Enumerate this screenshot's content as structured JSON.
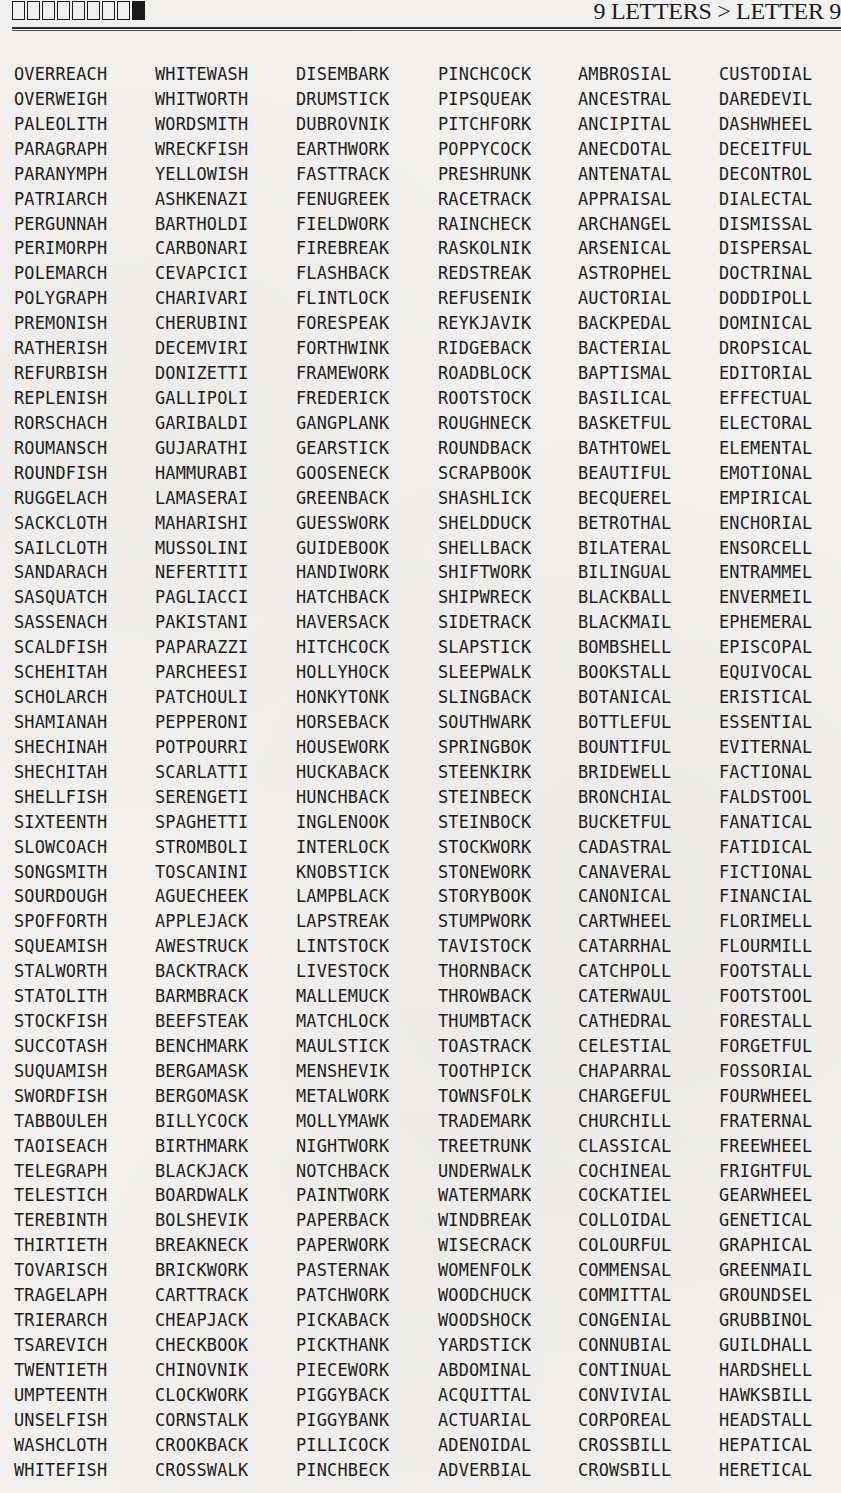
{
  "header": {
    "letter_boxes": {
      "total": 9,
      "filled_index": 8,
      "icon": "letter-position-boxes"
    },
    "breadcrumb": "9 LETTERS > LETTER 9"
  },
  "columns": [
    [
      "OVERREACH",
      "OVERWEIGH",
      "PALEOLITH",
      "PARAGRAPH",
      "PARANYMPH",
      "PATRIARCH",
      "PERGUNNAH",
      "PERIMORPH",
      "POLEMARCH",
      "POLYGRAPH",
      "PREMONISH",
      "RATHERISH",
      "REFURBISH",
      "REPLENISH",
      "RORSCHACH",
      "ROUMANSCH",
      "ROUNDFISH",
      "RUGGELACH",
      "SACKCLOTH",
      "SAILCLOTH",
      "SANDARACH",
      "SASQUATCH",
      "SASSENACH",
      "SCALDFISH",
      "SCHEHITAH",
      "SCHOLARCH",
      "SHAMIANAH",
      "SHECHINAH",
      "SHECHITAH",
      "SHELLFISH",
      "SIXTEENTH",
      "SLOWCOACH",
      "SONGSMITH",
      "SOURDOUGH",
      "SPOFFORTH",
      "SQUEAMISH",
      "STALWORTH",
      "STATOLITH",
      "STOCKFISH",
      "SUCCOTASH",
      "SUQUAMISH",
      "SWORDFISH",
      "TABBOULEH",
      "TAOISEACH",
      "TELEGRAPH",
      "TELESTICH",
      "TEREBINTH",
      "THIRTIETH",
      "TOVARISCH",
      "TRAGELAPH",
      "TRIERARCH",
      "TSAREVICH",
      "TWENTIETH",
      "UMPTEENTH",
      "UNSELFISH",
      "WASHCLOTH",
      "WHITEFISH"
    ],
    [
      "WHITEWASH",
      "WHITWORTH",
      "WORDSMITH",
      "WRECKFISH",
      "YELLOWISH",
      "ASHKENAZI",
      "BARTHOLDI",
      "CARBONARI",
      "CEVAPCICI",
      "CHARIVARI",
      "CHERUBINI",
      "DECEMVIRI",
      "DONIZETTI",
      "GALLIPOLI",
      "GARIBALDI",
      "GUJARATHI",
      "HAMMURABI",
      "LAMASERAI",
      "MAHARISHI",
      "MUSSOLINI",
      "NEFERTITI",
      "PAGLIACCI",
      "PAKISTANI",
      "PAPARAZZI",
      "PARCHEESI",
      "PATCHOULI",
      "PEPPERONI",
      "POTPOURRI",
      "SCARLATTI",
      "SERENGETI",
      "SPAGHETTI",
      "STROMBOLI",
      "TOSCANINI",
      "AGUECHEEK",
      "APPLEJACK",
      "AWESTRUCK",
      "BACKTRACK",
      "BARMBRACK",
      "BEEFSTEAK",
      "BENCHMARK",
      "BERGAMASK",
      "BERGOMASK",
      "BILLYCOCK",
      "BIRTHMARK",
      "BLACKJACK",
      "BOARDWALK",
      "BOLSHEVIK",
      "BREAKNECK",
      "BRICKWORK",
      "CARTTRACK",
      "CHEAPJACK",
      "CHECKBOOK",
      "CHINOVNIK",
      "CLOCKWORK",
      "CORNSTALK",
      "CROOKBACK",
      "CROSSWALK"
    ],
    [
      "DISEMBARK",
      "DRUMSTICK",
      "DUBROVNIK",
      "EARTHWORK",
      "FASTTRACK",
      "FENUGREEK",
      "FIELDWORK",
      "FIREBREAK",
      "FLASHBACK",
      "FLINTLOCK",
      "FORESPEAK",
      "FORTHWINK",
      "FRAMEWORK",
      "FREDERICK",
      "GANGPLANK",
      "GEARSTICK",
      "GOOSENECK",
      "GREENBACK",
      "GUESSWORK",
      "GUIDEBOOK",
      "HANDIWORK",
      "HATCHBACK",
      "HAVERSACK",
      "HITCHCOCK",
      "HOLLYHOCK",
      "HONKYTONK",
      "HORSEBACK",
      "HOUSEWORK",
      "HUCKABACK",
      "HUNCHBACK",
      "INGLENOOK",
      "INTERLOCK",
      "KNOBSTICK",
      "LAMPBLACK",
      "LAPSTREAK",
      "LINTSTOCK",
      "LIVESTOCK",
      "MALLEMUCK",
      "MATCHLOCK",
      "MAULSTICK",
      "MENSHEVIK",
      "METALWORK",
      "MOLLYMAWK",
      "NIGHTWORK",
      "NOTCHBACK",
      "PAINTWORK",
      "PAPERBACK",
      "PAPERWORK",
      "PASTERNAK",
      "PATCHWORK",
      "PICKABACK",
      "PICKTHANK",
      "PIECEWORK",
      "PIGGYBACK",
      "PIGGYBANK",
      "PILLICOCK",
      "PINCHBECK"
    ],
    [
      "PINCHCOCK",
      "PIPSQUEAK",
      "PITCHFORK",
      "POPPYCOCK",
      "PRESHRUNK",
      "RACETRACK",
      "RAINCHECK",
      "RASKOLNIK",
      "REDSTREAK",
      "REFUSENIK",
      "REYKJAVIK",
      "RIDGEBACK",
      "ROADBLOCK",
      "ROOTSTOCK",
      "ROUGHNECK",
      "ROUNDBACK",
      "SCRAPBOOK",
      "SHASHLICK",
      "SHELDDUCK",
      "SHELLBACK",
      "SHIFTWORK",
      "SHIPWRECK",
      "SIDETRACK",
      "SLAPSTICK",
      "SLEEPWALK",
      "SLINGBACK",
      "SOUTHWARK",
      "SPRINGBOK",
      "STEENKIRK",
      "STEINBECK",
      "STEINBOCK",
      "STOCKWORK",
      "STONEWORK",
      "STORYBOOK",
      "STUMPWORK",
      "TAVISTOCK",
      "THORNBACK",
      "THROWBACK",
      "THUMBTACK",
      "TOASTRACK",
      "TOOTHPICK",
      "TOWNSFOLK",
      "TRADEMARK",
      "TREETRUNK",
      "UNDERWALK",
      "WATERMARK",
      "WINDBREAK",
      "WISECRACK",
      "WOMENFOLK",
      "WOODCHUCK",
      "WOODSHOCK",
      "YARDSTICK",
      "ABDOMINAL",
      "ACQUITTAL",
      "ACTUARIAL",
      "ADENOIDAL",
      "ADVERBIAL"
    ],
    [
      "AMBROSIAL",
      "ANCESTRAL",
      "ANCIPITAL",
      "ANECDOTAL",
      "ANTENATAL",
      "APPRAISAL",
      "ARCHANGEL",
      "ARSENICAL",
      "ASTROPHEL",
      "AUCTORIAL",
      "BACKPEDAL",
      "BACTERIAL",
      "BAPTISMAL",
      "BASILICAL",
      "BASKETFUL",
      "BATHTOWEL",
      "BEAUTIFUL",
      "BECQUEREL",
      "BETROTHAL",
      "BILATERAL",
      "BILINGUAL",
      "BLACKBALL",
      "BLACKMAIL",
      "BOMBSHELL",
      "BOOKSTALL",
      "BOTANICAL",
      "BOTTLEFUL",
      "BOUNTIFUL",
      "BRIDEWELL",
      "BRONCHIAL",
      "BUCKETFUL",
      "CADASTRAL",
      "CANAVERAL",
      "CANONICAL",
      "CARTWHEEL",
      "CATARRHAL",
      "CATCHPOLL",
      "CATERWAUL",
      "CATHEDRAL",
      "CELESTIAL",
      "CHAPARRAL",
      "CHARGEFUL",
      "CHURCHILL",
      "CLASSICAL",
      "COCHINEAL",
      "COCKATIEL",
      "COLLOIDAL",
      "COLOURFUL",
      "COMMENSAL",
      "COMMITTAL",
      "CONGENIAL",
      "CONNUBIAL",
      "CONTINUAL",
      "CONVIVIAL",
      "CORPOREAL",
      "CROSSBILL",
      "CROWSBILL"
    ],
    [
      "CUSTODIAL",
      "DAREDEVIL",
      "DASHWHEEL",
      "DECEITFUL",
      "DECONTROL",
      "DIALECTAL",
      "DISMISSAL",
      "DISPERSAL",
      "DOCTRINAL",
      "DODDIPOLL",
      "DOMINICAL",
      "DROPSICAL",
      "EDITORIAL",
      "EFFECTUAL",
      "ELECTORAL",
      "ELEMENTAL",
      "EMOTIONAL",
      "EMPIRICAL",
      "ENCHORIAL",
      "ENSORCELL",
      "ENTRAMMEL",
      "ENVERMEIL",
      "EPHEMERAL",
      "EPISCOPAL",
      "EQUIVOCAL",
      "ERISTICAL",
      "ESSENTIAL",
      "EVITERNAL",
      "FACTIONAL",
      "FALDSTOOL",
      "FANATICAL",
      "FATIDICAL",
      "FICTIONAL",
      "FINANCIAL",
      "FLORIMELL",
      "FLOURMILL",
      "FOOTSTALL",
      "FOOTSTOOL",
      "FORESTALL",
      "FORGETFUL",
      "FOSSORIAL",
      "FOURWHEEL",
      "FRATERNAL",
      "FREEWHEEL",
      "FRIGHTFUL",
      "GEARWHEEL",
      "GENETICAL",
      "GRAPHICAL",
      "GREENMAIL",
      "GROUNDSEL",
      "GRUBBINOL",
      "GUILDHALL",
      "HARDSHELL",
      "HAWKSBILL",
      "HEADSTALL",
      "HEPATICAL",
      "HERETICAL"
    ]
  ]
}
